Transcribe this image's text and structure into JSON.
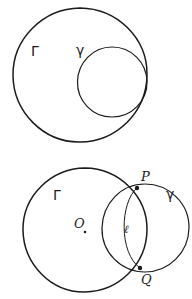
{
  "document": {
    "kind": "hand-drawn-geometry-diagram",
    "background_color": "#ffffff",
    "ink_color": "#1c1a1a",
    "width": 192,
    "height": 299,
    "figure_count": 2
  },
  "figures": [
    {
      "id": "figure-top",
      "caption": "",
      "description": "Large circle with a smaller circle internally tangent at the right",
      "labels": {
        "big_circle": "Γ",
        "small_circle": "γ"
      },
      "shapes": [
        {
          "name": "big-circle",
          "type": "circle",
          "cx": 80,
          "cy": 75,
          "r": 67
        },
        {
          "name": "small-circle",
          "type": "circle",
          "cx": 112,
          "cy": 82,
          "r": 35
        }
      ],
      "label_positions": [
        {
          "name": "gamma-big-label",
          "text": "Γ",
          "x": 31,
          "y": 56
        },
        {
          "name": "gamma-small-label",
          "text": "γ",
          "x": 76,
          "y": 55
        }
      ]
    },
    {
      "id": "figure-bottom",
      "caption": "",
      "description": "Large circle with center O intersecting a second circle at points P and Q; arc l joins P and Q",
      "labels": {
        "big_circle": "Γ",
        "small_circle": "γ",
        "center": "O",
        "point_upper": "P",
        "point_lower": "Q",
        "arc": "ℓ"
      },
      "shapes": [
        {
          "name": "big-circle",
          "type": "circle",
          "cx": 85,
          "cy": 230,
          "r": 62
        },
        {
          "name": "small-circle",
          "type": "circle",
          "cx": 145,
          "cy": 228,
          "r": 44
        },
        {
          "name": "arc-l",
          "type": "arc",
          "from": "P",
          "to": "Q"
        }
      ],
      "points": [
        {
          "name": "center-O",
          "label": "O",
          "x": 83,
          "y": 228
        },
        {
          "name": "point-P",
          "label": "P",
          "x": 137,
          "y": 188
        },
        {
          "name": "point-Q",
          "label": "Q",
          "x": 140,
          "y": 268
        }
      ],
      "label_positions": [
        {
          "name": "gamma-big-label",
          "text": "Γ",
          "x": 53,
          "y": 200
        },
        {
          "name": "gamma-small-label",
          "text": "γ",
          "x": 166,
          "y": 199
        },
        {
          "name": "center-label",
          "text": "O",
          "x": 74,
          "y": 228
        },
        {
          "name": "point-p-label",
          "text": "P",
          "x": 142,
          "y": 181
        },
        {
          "name": "point-q-label",
          "text": "Q",
          "x": 142,
          "y": 282
        },
        {
          "name": "arc-label",
          "text": "ℓ",
          "x": 126,
          "y": 231
        }
      ]
    }
  ]
}
